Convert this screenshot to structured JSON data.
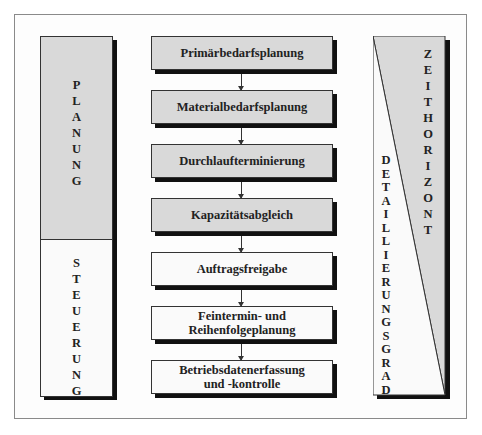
{
  "diagram": {
    "left_column": {
      "upper": {
        "label": "PLANUNG",
        "letters": [
          "P",
          "L",
          "A",
          "N",
          "U",
          "N",
          "G"
        ],
        "fill": "#d9d9d9"
      },
      "lower": {
        "label": "STEUERUNG",
        "letters": [
          "S",
          "T",
          "E",
          "U",
          "E",
          "R",
          "U",
          "N",
          "G"
        ],
        "fill": "#fafafa"
      }
    },
    "center_steps": [
      {
        "label": "Primärbedarfsplanung",
        "lines": [
          "Primärbedarfsplanung"
        ],
        "phase": "planung"
      },
      {
        "label": "Materialbedarfsplanung",
        "lines": [
          "Materialbedarfsplanung"
        ],
        "phase": "planung"
      },
      {
        "label": "Durchlaufterminierung",
        "lines": [
          "Durchlaufterminierung"
        ],
        "phase": "planung"
      },
      {
        "label": "Kapazitätsabgleich",
        "lines": [
          "Kapazitätsabgleich"
        ],
        "phase": "planung"
      },
      {
        "label": "Auftragsfreigabe",
        "lines": [
          "Auftragsfreigabe"
        ],
        "phase": "steuerung"
      },
      {
        "label": "Feintermin- und Reihenfolgeplanung",
        "lines": [
          "Feintermin- und",
          "Reihenfolgeplanung"
        ],
        "phase": "steuerung"
      },
      {
        "label": "Betriebsdatenerfassung und -kontrolle",
        "lines": [
          "Betriebsdatenerfassung",
          "und -kontrolle"
        ],
        "phase": "steuerung"
      }
    ],
    "right_column": {
      "top_right_triangle": {
        "label": "ZEITHORIZONT",
        "letters": [
          "Z",
          "E",
          "I",
          "T",
          "H",
          "O",
          "R",
          "I",
          "Z",
          "O",
          "N",
          "T"
        ],
        "fill": "#d9d9d9"
      },
      "bottom_left_triangle": {
        "label": "DETAILLIERUNGSGRAD",
        "letters": [
          "D",
          "E",
          "T",
          "A",
          "I",
          "L",
          "L",
          "I",
          "E",
          "R",
          "U",
          "N",
          "G",
          "S",
          "G",
          "R",
          "A",
          "D"
        ],
        "fill": "#fafafa"
      }
    },
    "colors": {
      "gray_fill": "#d9d9d9",
      "white_fill": "#fafafa",
      "shadow": "#111111",
      "border": "#333333"
    }
  }
}
